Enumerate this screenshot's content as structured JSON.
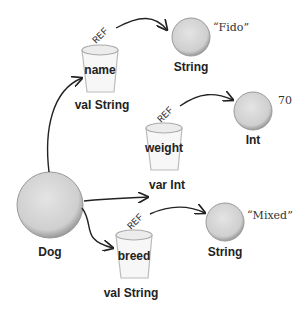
{
  "diagram": {
    "root": {
      "label": "Dog"
    },
    "properties": [
      {
        "name": "name",
        "type_label": "val String",
        "ref_label": "REF",
        "object_type": "String",
        "object_value": "“Fido”"
      },
      {
        "name": "weight",
        "type_label": "var Int",
        "ref_label": "REF",
        "object_type": "Int",
        "object_value": "70"
      },
      {
        "name": "breed",
        "type_label": "val String",
        "ref_label": "REF",
        "object_type": "String",
        "object_value": "“Mixed”"
      }
    ]
  }
}
